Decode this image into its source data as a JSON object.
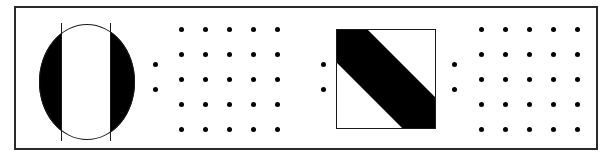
{
  "figure": {
    "background_color": "#ffffff",
    "ink_color": "#000000",
    "frame": {
      "label": "outer rectangular border",
      "x": 14,
      "y": 6,
      "width": 584,
      "height": 144,
      "border_color": "#2a2a2a",
      "border_width": 2,
      "fill_color": "#ffffff"
    },
    "elements": [
      {
        "id": "circle-glyph",
        "label": "black circle with white vertical band",
        "shape": "circle",
        "x": 37,
        "y": 22,
        "width": 96,
        "height": 116,
        "fill_color": "#000000",
        "band": {
          "label": "white vertical band",
          "offset_x": 22,
          "width": 50,
          "fill_color": "#ffffff",
          "outline_color": "#1a1a1a"
        }
      },
      {
        "id": "dot-matrix-left-pair-a",
        "label": "left pair of dots before first matrix",
        "shape": "dot-column",
        "dot_radius": 2.5,
        "fill_color": "#000000",
        "dots": [
          {
            "x": 153,
            "y": 62
          },
          {
            "x": 153,
            "y": 87
          }
        ]
      },
      {
        "id": "dot-matrix-1",
        "label": "first 5 by 5 dot matrix",
        "shape": "dot-grid",
        "rows": 5,
        "columns": 5,
        "origin_x": 179,
        "origin_y": 27,
        "spacing_x": 24,
        "spacing_y": 25,
        "dot_radius": 2.5,
        "fill_color": "#000000"
      },
      {
        "id": "dot-matrix-left-pair-b",
        "label": "left pair of dots before square glyph",
        "shape": "dot-column",
        "dot_radius": 2.5,
        "fill_color": "#000000",
        "dots": [
          {
            "x": 321,
            "y": 62
          },
          {
            "x": 321,
            "y": 87
          }
        ]
      },
      {
        "id": "square-glyph",
        "label": "black square with white diagonal corner triangles",
        "shape": "square",
        "x": 334,
        "y": 27,
        "width": 100,
        "height": 100,
        "fill_color": "#000000",
        "outline_color": "#1a1a1a",
        "diagonal": {
          "label": "descending diagonal band",
          "direction": "top-left to bottom-right",
          "white_corners": [
            "top-right",
            "bottom-left"
          ],
          "corner_fill_color": "#ffffff"
        }
      },
      {
        "id": "dot-matrix-left-pair-c",
        "label": "left pair of dots before second matrix",
        "shape": "dot-column",
        "dot_radius": 2.5,
        "fill_color": "#000000",
        "dots": [
          {
            "x": 452,
            "y": 62
          },
          {
            "x": 452,
            "y": 87
          }
        ]
      },
      {
        "id": "dot-matrix-2",
        "label": "second 5 by 5 dot matrix",
        "shape": "dot-grid",
        "rows": 5,
        "columns": 5,
        "origin_x": 479,
        "origin_y": 27,
        "spacing_x": 24,
        "spacing_y": 25,
        "dot_radius": 2.5,
        "fill_color": "#000000"
      }
    ]
  }
}
